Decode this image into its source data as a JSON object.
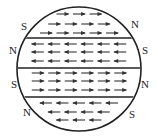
{
  "diagram": {
    "circle": {
      "cx": 79,
      "cy": 69,
      "r": 62
    },
    "dividers_y": [
      38,
      68,
      97
    ],
    "bands": [
      {
        "direction": "right",
        "rows": [
          {
            "y": 14,
            "count": 3
          },
          {
            "y": 24,
            "count": 4
          },
          {
            "y": 33,
            "count": 5
          }
        ],
        "left_pole": "S",
        "right_pole": "N"
      },
      {
        "direction": "left",
        "rows": [
          {
            "y": 44,
            "count": 6
          },
          {
            "y": 52,
            "count": 6
          },
          {
            "y": 61,
            "count": 6
          }
        ],
        "left_pole": "N",
        "right_pole": "S"
      },
      {
        "direction": "right",
        "rows": [
          {
            "y": 73,
            "count": 6
          },
          {
            "y": 81,
            "count": 6
          },
          {
            "y": 90,
            "count": 6
          }
        ],
        "left_pole": "S",
        "right_pole": "N"
      },
      {
        "direction": "left",
        "rows": [
          {
            "y": 103,
            "count": 5
          },
          {
            "y": 112,
            "count": 4
          },
          {
            "y": 120,
            "count": 3
          }
        ],
        "left_pole": "N",
        "right_pole": "S"
      }
    ],
    "labels": [
      {
        "text": "S",
        "x": 21,
        "y": 21
      },
      {
        "text": "N",
        "x": 131,
        "y": 19
      },
      {
        "text": "N",
        "x": 9,
        "y": 45
      },
      {
        "text": "S",
        "x": 142,
        "y": 45
      },
      {
        "text": "S",
        "x": 11,
        "y": 79
      },
      {
        "text": "N",
        "x": 141,
        "y": 79
      },
      {
        "text": "N",
        "x": 23,
        "y": 107
      },
      {
        "text": "S",
        "x": 129,
        "y": 109
      }
    ],
    "colors": {
      "stroke": "#222222",
      "arrow": "#333333"
    }
  }
}
